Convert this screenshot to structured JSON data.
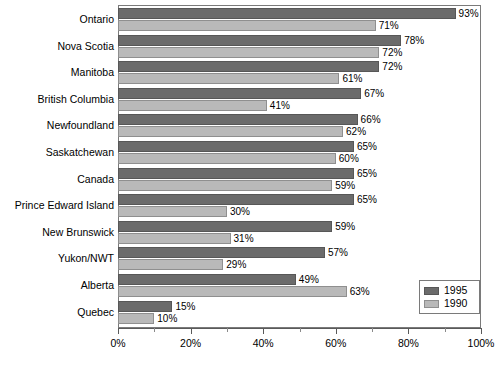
{
  "chart_data": {
    "type": "bar",
    "orientation": "horizontal",
    "title": "",
    "xlabel": "",
    "ylabel": "",
    "xlim": [
      0,
      100
    ],
    "xunit": "%",
    "grid": false,
    "legend_position": "bottom-right",
    "categories": [
      "Ontario",
      "Nova Scotia",
      "Manitoba",
      "British Columbia",
      "Newfoundland",
      "Saskatchewan",
      "Canada",
      "Prince Edward Island",
      "New Brunswick",
      "Yukon/NWT",
      "Alberta",
      "Quebec"
    ],
    "series": [
      {
        "name": "1995",
        "color": "#6b6b6b",
        "values": [
          93,
          78,
          72,
          67,
          66,
          65,
          65,
          65,
          59,
          57,
          49,
          15
        ],
        "labels": [
          "93%",
          "78%",
          "72%",
          "67%",
          "66%",
          "65%",
          "65%",
          "65%",
          "59%",
          "57%",
          "49%",
          "15%"
        ]
      },
      {
        "name": "1990",
        "color": "#b9b9b9",
        "values": [
          71,
          72,
          61,
          41,
          62,
          60,
          59,
          30,
          31,
          29,
          63,
          10
        ],
        "labels": [
          "71%",
          "72%",
          "61%",
          "41%",
          "62%",
          "60%",
          "59%",
          "30%",
          "31%",
          "29%",
          "63%",
          "10%"
        ]
      }
    ],
    "x_ticks": [
      0,
      20,
      40,
      60,
      80,
      100
    ],
    "x_tick_labels": [
      "0%",
      "20%",
      "40%",
      "60%",
      "80%",
      "100%"
    ],
    "x_minor_ticks": [
      10,
      30,
      50,
      70,
      90
    ]
  },
  "legend": {
    "entries": [
      {
        "label": "1995"
      },
      {
        "label": "1990"
      }
    ]
  }
}
